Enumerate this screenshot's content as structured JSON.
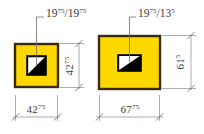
{
  "drawing": {
    "title": "profile-cross-section-dimensions",
    "background": "#ffffff",
    "colors": {
      "body_fill": "#FFD800",
      "body_stroke": "#3B2A10",
      "cavity_fill": "#000000",
      "cavity_stroke": "#000000",
      "cavity_light": "#FFFFFF",
      "dimension_line": "#7A7A7A",
      "text": "#3A3A3A"
    },
    "leaders": [
      {
        "name": "leader-left",
        "value": "19",
        "value_sup": "75",
        "separator": "/",
        "value2": "19",
        "value2_sup": "75",
        "full": "19 75 / 19 75"
      },
      {
        "name": "leader-right",
        "value": "19",
        "value_sup": "75",
        "separator": "/",
        "value2": "13",
        "value2_sup": "5",
        "full": "19 75 / 13 5"
      }
    ],
    "dimensions": [
      {
        "name": "height-left",
        "orientation": "vertical",
        "value": "42",
        "sup": "75",
        "full": "42 75"
      },
      {
        "name": "height-right",
        "orientation": "vertical",
        "value": "61",
        "sup": "5",
        "full": "61 5"
      },
      {
        "name": "width-left",
        "orientation": "horizontal",
        "value": "42",
        "sup": "75",
        "full": "42 75"
      },
      {
        "name": "width-right",
        "orientation": "horizontal",
        "value": "67",
        "sup": "75",
        "full": "67 75"
      }
    ],
    "shapes": [
      {
        "name": "profile-left",
        "type": "square"
      },
      {
        "name": "profile-right",
        "type": "rectangle"
      }
    ]
  }
}
